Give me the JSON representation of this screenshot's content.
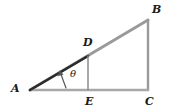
{
  "figure": {
    "background_color": "#ffffff",
    "stroke_colors": {
      "outer_triangle": "#9a9a9a",
      "inner_hypotenuse": "#2b2b2b",
      "inner_vertical": "#8c8c8c",
      "baseline": "#a8a8a8",
      "angle_arrow": "#555555"
    },
    "labels": {
      "A": "A",
      "B": "B",
      "C": "C",
      "D": "D",
      "E": "E",
      "theta": "θ"
    },
    "points": {
      "A": {
        "x": 30,
        "y": 90
      },
      "B": {
        "x": 148,
        "y": 20
      },
      "C": {
        "x": 148,
        "y": 90
      },
      "D": {
        "x": 88,
        "y": 56
      },
      "E": {
        "x": 88,
        "y": 90
      }
    },
    "segments": [
      {
        "name": "A-B hypotenuse",
        "from": "A",
        "to": "B"
      },
      {
        "name": "B-C vertical leg",
        "from": "B",
        "to": "C"
      },
      {
        "name": "A-C horizontal base",
        "from": "A",
        "to": "C"
      },
      {
        "name": "A-D inner hypotenuse",
        "from": "A",
        "to": "D"
      },
      {
        "name": "D-E inner vertical leg",
        "from": "D",
        "to": "E"
      }
    ],
    "angle": {
      "at_vertex": "A",
      "symbol": "θ",
      "between": [
        "A-C",
        "A-D"
      ]
    }
  }
}
